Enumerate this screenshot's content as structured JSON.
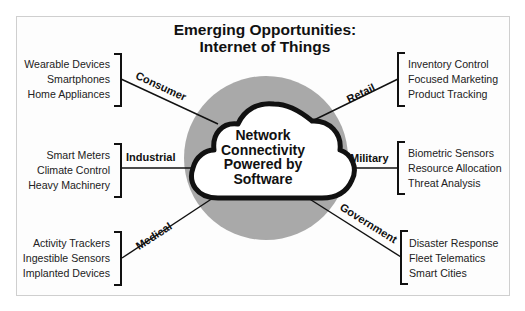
{
  "title": {
    "line1": "Emerging Opportunities:",
    "line2": "Internet of Things"
  },
  "center": {
    "line1": "Network",
    "line2": "Connectivity",
    "line3": "Powered by",
    "line4": "Software"
  },
  "categories": {
    "consumer": {
      "label": "Consumer",
      "items": [
        "Wearable Devices",
        "Smartphones",
        "Home Appliances"
      ]
    },
    "industrial": {
      "label": "Industrial",
      "items": [
        "Smart Meters",
        "Climate Control",
        "Heavy Machinery"
      ]
    },
    "medical": {
      "label": "Medical",
      "items": [
        "Activity Trackers",
        "Ingestible Sensors",
        "Implanted Devices"
      ]
    },
    "retail": {
      "label": "Retail",
      "items": [
        "Inventory Control",
        "Focused Marketing",
        "Product Tracking"
      ]
    },
    "military": {
      "label": "Military",
      "items": [
        "Biometric Sensors",
        "Resource Allocation",
        "Threat Analysis"
      ]
    },
    "government": {
      "label": "Government",
      "items": [
        "Disaster Response",
        "Fleet Telematics",
        "Smart Cities"
      ]
    }
  },
  "colors": {
    "circle": "#a9a9a9",
    "cloud_fill": "#ffffff",
    "cloud_stroke": "#111111",
    "line": "#111111"
  }
}
